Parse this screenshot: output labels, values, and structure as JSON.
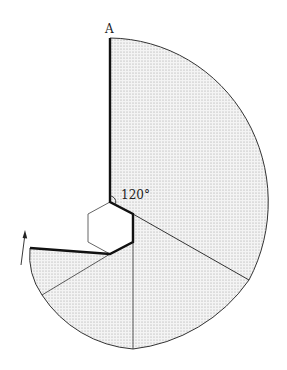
{
  "figure": {
    "point_label": "A",
    "angle_label": "120°",
    "colors": {
      "fill": "#d8d8d8",
      "stroke": "#333333",
      "background": "#ffffff"
    }
  }
}
